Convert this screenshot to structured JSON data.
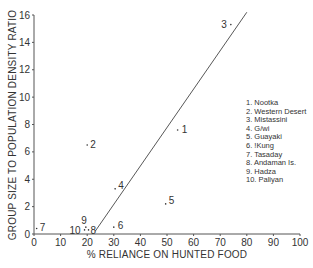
{
  "chart_data": {
    "type": "scatter",
    "title": "",
    "xlabel": "% RELIANCE ON HUNTED FOOD",
    "ylabel": "GROUP SIZE TO POPULATION DENSITY RATIO",
    "xlim": [
      0,
      100
    ],
    "ylim": [
      0,
      16
    ],
    "x_ticks": [
      0,
      10,
      20,
      30,
      40,
      50,
      60,
      70,
      80,
      90,
      100
    ],
    "y_ticks": [
      0,
      2,
      4,
      6,
      8,
      10,
      12,
      14,
      16
    ],
    "grid": false,
    "legend_position": "right-middle",
    "points": [
      {
        "id": "1",
        "name": "Nootka",
        "x": 54,
        "y": 7.6
      },
      {
        "id": "2",
        "name": "Western Desert",
        "x": 20,
        "y": 6.5
      },
      {
        "id": "3",
        "name": "Mistassini",
        "x": 74,
        "y": 15.3
      },
      {
        "id": "4",
        "name": "G/wi",
        "x": 30.5,
        "y": 3.3
      },
      {
        "id": "5",
        "name": "Guayaki",
        "x": 49.5,
        "y": 2.2
      },
      {
        "id": "6",
        "name": "!Kung",
        "x": 30,
        "y": 0.5
      },
      {
        "id": "7",
        "name": "Tasaday",
        "x": 1,
        "y": 0.4
      },
      {
        "id": "8",
        "name": "Andaman Is.",
        "x": 20.5,
        "y": 0.3
      },
      {
        "id": "9",
        "name": "Hadza",
        "x": 19.5,
        "y": 0.5
      },
      {
        "id": "10",
        "name": "Paliyan",
        "x": 19,
        "y": 0.3
      }
    ],
    "trend_line": {
      "x1": 23,
      "y1": 0.2,
      "x2": 80,
      "y2": 16.2
    }
  },
  "legend": [
    "1. Nootka",
    "2. Western Desert",
    "3. Mistassini",
    "4. G/wi",
    "5. Guayaki",
    "6. !Kung",
    "7. Tasaday",
    "8. Andaman Is.",
    "9. Hadza",
    "10. Paliyan"
  ]
}
